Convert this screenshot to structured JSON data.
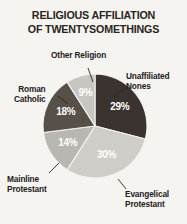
{
  "chart_data": {
    "type": "pie",
    "title": "RELIGIOUS AFFILIATION OF TWENTYSOMETHINGS",
    "title_lines": [
      "RELIGIOUS AFFILIATION",
      "OF TWENTYSOMETHINGS"
    ],
    "categories": [
      "Unaffiliated Nones",
      "Evangelical Protestant",
      "Mainline Protestant",
      "Roman Catholic",
      "Other Religion"
    ],
    "values": [
      29,
      30,
      14,
      18,
      9
    ],
    "value_labels": [
      "29%",
      "30%",
      "14%",
      "18%",
      "9%"
    ],
    "colors": [
      "#3a332f",
      "#cfcdc8",
      "#b9b7b2",
      "#565049",
      "#c8c6c1"
    ],
    "unit": "%",
    "legend": "none",
    "start_angle_deg": 0,
    "direction": "clockwise",
    "xlabel": "",
    "ylabel": "",
    "slices": [
      {
        "name": "Unaffiliated Nones",
        "label_lines": [
          "Unaffiliated",
          "Nones"
        ],
        "value": 29,
        "value_label": "29%",
        "color": "#3a332f"
      },
      {
        "name": "Evangelical Protestant",
        "label_lines": [
          "Evangelical",
          "Protestant"
        ],
        "value": 30,
        "value_label": "30%",
        "color": "#cfcdc8"
      },
      {
        "name": "Mainline Protestant",
        "label_lines": [
          "Mainline",
          "Protestant"
        ],
        "value": 14,
        "value_label": "14%",
        "color": "#b9b7b2"
      },
      {
        "name": "Roman Catholic",
        "label_lines": [
          "Roman",
          "Catholic"
        ],
        "value": 18,
        "value_label": "18%",
        "color": "#565049"
      },
      {
        "name": "Other Religion",
        "label_lines": [
          "Other Religion"
        ],
        "value": 9,
        "value_label": "9%",
        "color": "#c8c6c1"
      }
    ]
  },
  "style": {
    "background": "#f6f4f0",
    "title_color": "#2a2520",
    "label_color": "#23201c",
    "value_label_color": "#ffffff",
    "leader_color": "#2a2520"
  }
}
